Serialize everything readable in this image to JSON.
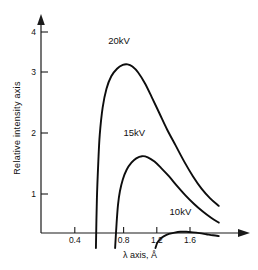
{
  "chart_data": {
    "type": "line",
    "title": "",
    "subtitle": "",
    "xlabel": "λ axis, Å",
    "ylabel": "Relative intensity axis",
    "xlim": [
      0.0,
      1.92
    ],
    "ylim": [
      0.0,
      4.3
    ],
    "grid": false,
    "legend_position": "inline-annotations",
    "xticks": [
      0.4,
      0.8,
      1.2,
      1.6
    ],
    "xtick_labels": [
      "0.4",
      "0.8",
      "1.2",
      "1.6"
    ],
    "yticks": [
      1,
      2,
      3,
      4
    ],
    "ytick_labels": [
      "1",
      "2",
      "3",
      "4"
    ],
    "series": [
      {
        "name": "20kV",
        "label": "20kV",
        "cutoff_wavelength": 0.62,
        "peak_x": 0.95,
        "peak_y": 3.4,
        "points": [
          [
            0.62,
            0.0
          ],
          [
            0.63,
            0.9
          ],
          [
            0.645,
            1.6
          ],
          [
            0.66,
            2.1
          ],
          [
            0.69,
            2.6
          ],
          [
            0.73,
            2.95
          ],
          [
            0.78,
            3.18
          ],
          [
            0.84,
            3.32
          ],
          [
            0.9,
            3.39
          ],
          [
            0.95,
            3.4
          ],
          [
            1.0,
            3.36
          ],
          [
            1.06,
            3.25
          ],
          [
            1.13,
            3.05
          ],
          [
            1.2,
            2.8
          ],
          [
            1.28,
            2.5
          ],
          [
            1.36,
            2.2
          ],
          [
            1.45,
            1.9
          ],
          [
            1.54,
            1.6
          ],
          [
            1.63,
            1.33
          ],
          [
            1.72,
            1.1
          ],
          [
            1.81,
            0.92
          ],
          [
            1.9,
            0.78
          ]
        ]
      },
      {
        "name": "15kV",
        "label": "15kV",
        "cutoff_wavelength": 0.82,
        "peak_x": 1.1,
        "peak_y": 1.7,
        "points": [
          [
            0.82,
            0.0
          ],
          [
            0.835,
            0.45
          ],
          [
            0.85,
            0.8
          ],
          [
            0.87,
            1.05
          ],
          [
            0.9,
            1.27
          ],
          [
            0.94,
            1.45
          ],
          [
            0.99,
            1.58
          ],
          [
            1.04,
            1.66
          ],
          [
            1.1,
            1.7
          ],
          [
            1.16,
            1.68
          ],
          [
            1.23,
            1.6
          ],
          [
            1.3,
            1.48
          ],
          [
            1.38,
            1.33
          ],
          [
            1.46,
            1.16
          ],
          [
            1.55,
            0.98
          ],
          [
            1.64,
            0.82
          ],
          [
            1.73,
            0.68
          ],
          [
            1.82,
            0.56
          ],
          [
            1.9,
            0.47
          ]
        ]
      },
      {
        "name": "10kV",
        "label": "10kV",
        "cutoff_wavelength": 1.24,
        "peak_x": 1.55,
        "peak_y": 0.3,
        "points": [
          [
            1.24,
            0.0
          ],
          [
            1.26,
            0.1
          ],
          [
            1.29,
            0.17
          ],
          [
            1.33,
            0.22
          ],
          [
            1.38,
            0.26
          ],
          [
            1.44,
            0.285
          ],
          [
            1.5,
            0.3
          ],
          [
            1.56,
            0.3
          ],
          [
            1.63,
            0.29
          ],
          [
            1.7,
            0.275
          ],
          [
            1.77,
            0.255
          ],
          [
            1.84,
            0.235
          ],
          [
            1.9,
            0.22
          ]
        ]
      }
    ],
    "annotations": [
      {
        "text": "20kV",
        "x": 0.86,
        "y": 3.78
      },
      {
        "text": "15kV",
        "x": 1.02,
        "y": 2.07
      },
      {
        "text": "10kV",
        "x": 1.5,
        "y": 0.62
      }
    ]
  }
}
